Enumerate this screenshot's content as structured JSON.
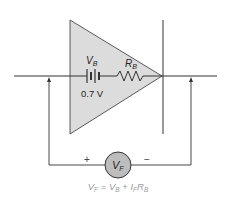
{
  "diagram": {
    "battery": {
      "symbol": "V",
      "subscript": "B",
      "value": "0.7 V"
    },
    "resistor": {
      "symbol": "R",
      "subscript": "B"
    },
    "meter": {
      "symbol": "V",
      "subscript": "F",
      "plus": "+",
      "minus": "−"
    },
    "formula": {
      "lhs_symbol": "V",
      "lhs_sub": "F",
      "eq": " = ",
      "t1_symbol": "V",
      "t1_sub": "B",
      "plus": " + ",
      "t2_symbol": "I",
      "t2_sub": "F",
      "t3_symbol": "R",
      "t3_sub": "B"
    },
    "colors": {
      "triangle_fill": "#dcdcdc",
      "meter_fill": "#bdbdbd",
      "line": "#333333",
      "formula_text": "#9a9a9a"
    }
  }
}
